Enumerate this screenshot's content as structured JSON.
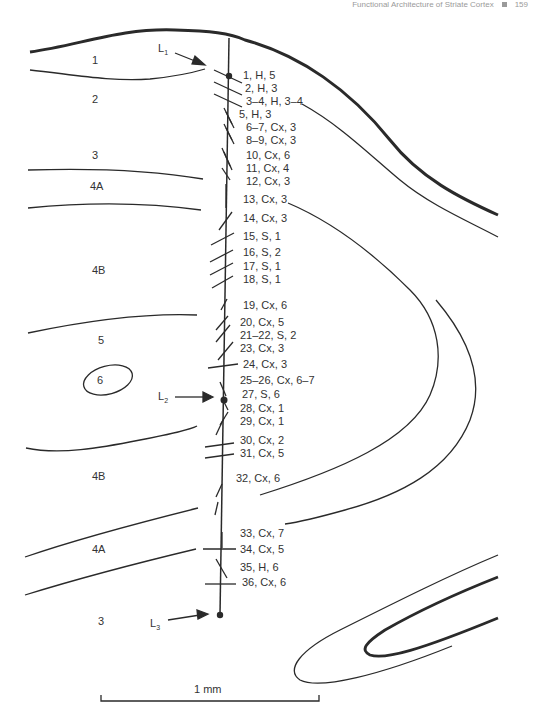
{
  "running_head": {
    "title": "Functional Architecture of Striate Cortex",
    "page_number": "159"
  },
  "layers": [
    {
      "label": "1",
      "x": 92,
      "y": 64
    },
    {
      "label": "2",
      "x": 92,
      "y": 103
    },
    {
      "label": "3",
      "x": 92,
      "y": 159
    },
    {
      "label": "4A",
      "x": 90,
      "y": 190
    },
    {
      "label": "4B",
      "x": 90,
      "y": 274
    },
    {
      "label": "5",
      "x": 96,
      "y": 344
    },
    {
      "label": "6",
      "x": 96,
      "y": 384
    },
    {
      "label": "4B",
      "x": 90,
      "y": 480
    },
    {
      "label": "4A",
      "x": 90,
      "y": 553
    },
    {
      "label": "3",
      "x": 96,
      "y": 625
    }
  ],
  "lesions": [
    {
      "label": "L1",
      "main": "L",
      "sub": "1"
    },
    {
      "label": "L2",
      "main": "L",
      "sub": "2"
    },
    {
      "label": "L3",
      "main": "L",
      "sub": "3"
    }
  ],
  "recording_sites": [
    {
      "text": "1, H, 5",
      "y": 79
    },
    {
      "text": "2, H, 3",
      "y": 92
    },
    {
      "text": "3–4, H, 3–4",
      "y": 105
    },
    {
      "text": "5, H, 3",
      "y": 118
    },
    {
      "text": "6–7, Cx, 3",
      "y": 131
    },
    {
      "text": "8–9, Cx, 3",
      "y": 144
    },
    {
      "text": "10, Cx, 6",
      "y": 159
    },
    {
      "text": "11, Cx, 4",
      "y": 172
    },
    {
      "text": "12, Cx, 3",
      "y": 185
    },
    {
      "text": "13, Cx, 3",
      "y": 203
    },
    {
      "text": "14, Cx, 3",
      "y": 222
    },
    {
      "text": "15, S, 1",
      "y": 240
    },
    {
      "text": "16, S, 2",
      "y": 256
    },
    {
      "text": "17, S, 1",
      "y": 270
    },
    {
      "text": "18, S, 1",
      "y": 283
    },
    {
      "text": "19, Cx, 6",
      "y": 309
    },
    {
      "text": "20, Cx, 5",
      "y": 326
    },
    {
      "text": "21–22, S, 2",
      "y": 339
    },
    {
      "text": "23, Cx, 3",
      "y": 352
    },
    {
      "text": "24, Cx, 3",
      "y": 368
    },
    {
      "text": "25–26, Cx, 6–7",
      "y": 384
    },
    {
      "text": "27, S, 6",
      "y": 398
    },
    {
      "text": "28, Cx, 1",
      "y": 412
    },
    {
      "text": "29, Cx, 1",
      "y": 425
    },
    {
      "text": "30, Cx, 2",
      "y": 444
    },
    {
      "text": "31, Cx, 5",
      "y": 457
    },
    {
      "text": "32, Cx, 6",
      "y": 482
    },
    {
      "text": "33, Cx, 7",
      "y": 537
    },
    {
      "text": "34, Cx, 5",
      "y": 553
    },
    {
      "text": "35, H, 6",
      "y": 571
    },
    {
      "text": "36, Cx, 6",
      "y": 586
    }
  ],
  "scale_bar": {
    "label": "1 mm"
  }
}
